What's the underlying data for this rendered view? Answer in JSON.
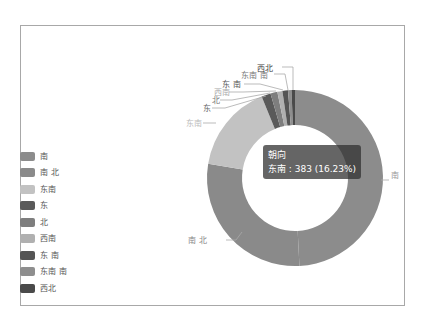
{
  "chart_data": {
    "type": "pie",
    "subtype": "donut",
    "series_name": "朝向",
    "categories": [
      "南",
      "南 北",
      "东南",
      "东",
      "北",
      "西南",
      "东 南",
      "东南 南",
      "西北"
    ],
    "values": [
      1161,
      670,
      383,
      40,
      30,
      22,
      24,
      15,
      15
    ],
    "colors": [
      "#8c8c8c",
      "#8a8a8a",
      "#c2c2c2",
      "#5a5a5a",
      "#7e7e7e",
      "#b0b0b0",
      "#555555",
      "#8e8e8e",
      "#4a4a4a"
    ],
    "legend_position": "left",
    "start_angle": 0,
    "direction": "clockwise"
  },
  "tooltip": {
    "title": "朝向",
    "line": "东南 : 383 (16.23%)"
  },
  "legend": {
    "items": [
      {
        "label": "南",
        "color": "#8c8c8c"
      },
      {
        "label": "南 北",
        "color": "#8a8a8a"
      },
      {
        "label": "东南",
        "color": "#c2c2c2"
      },
      {
        "label": "东",
        "color": "#5a5a5a"
      },
      {
        "label": "北",
        "color": "#7e7e7e"
      },
      {
        "label": "西南",
        "color": "#b0b0b0"
      },
      {
        "label": "东 南",
        "color": "#555555"
      },
      {
        "label": "东南 南",
        "color": "#8e8e8e"
      },
      {
        "label": "西北",
        "color": "#4a4a4a"
      }
    ]
  },
  "slice_labels": [
    {
      "text": "南",
      "x": 391,
      "y": 178,
      "anchor": "start",
      "color": "#999",
      "line": "M381,180 L389,180"
    },
    {
      "text": "南 北",
      "x": 188,
      "y": 243,
      "anchor": "start",
      "color": "#888",
      "line": "M226,240 L236,240 L242,232"
    },
    {
      "text": "东南",
      "x": 186,
      "y": 126,
      "anchor": "start",
      "color": "#bbb",
      "line": "M203,123 L216,123"
    },
    {
      "text": "东",
      "x": 203,
      "y": 111,
      "anchor": "start",
      "color": "#666",
      "line": "M212,108 L225,108 L266,96"
    },
    {
      "text": "北",
      "x": 212,
      "y": 103,
      "anchor": "start",
      "color": "#777",
      "line": "M220,100 L232,100 L270,93"
    },
    {
      "text": "西南",
      "x": 214,
      "y": 95,
      "anchor": "start",
      "color": "#aaa",
      "line": "M229,92 L243,92 L276,91"
    },
    {
      "text": "东 南",
      "x": 222,
      "y": 87,
      "anchor": "start",
      "color": "#555",
      "line": "M244,84 L260,84 L283,90"
    },
    {
      "text": "东南 南",
      "x": 241,
      "y": 78,
      "anchor": "start",
      "color": "#777",
      "line": "M274,74 L285,74 L288,90"
    },
    {
      "text": "西北",
      "x": 257,
      "y": 71,
      "anchor": "start",
      "color": "#444",
      "line": "M282,67 L293,67 L293,90"
    }
  ]
}
